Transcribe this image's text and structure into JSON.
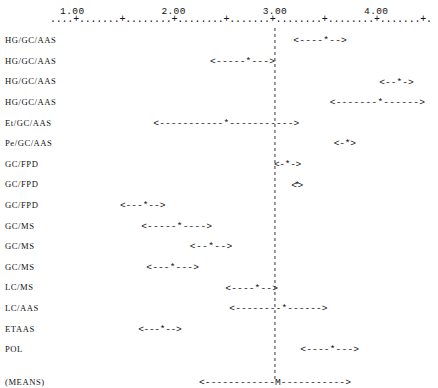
{
  "chart_data": {
    "type": "scatter",
    "plot_style": "ascii-confidence-interval-forest-plot",
    "title": "",
    "subtitle": "",
    "xlabel": "",
    "ylabel": "",
    "xlim": [
      0.75,
      4.6
    ],
    "grid": false,
    "legend": null,
    "axis": {
      "tick_labels": [
        "1.00",
        "2.00",
        "3.00",
        "4.00"
      ],
      "tick_values": [
        1.0,
        2.0,
        3.0,
        4.0
      ],
      "minor_tick_step": 0.5,
      "axis_glyph_major": "+",
      "axis_glyph_minor": ".",
      "axis_start_value": 0.78,
      "axis_end_value": 4.55
    },
    "reference_line": {
      "value": 3.0,
      "style": "dashed",
      "label": ""
    },
    "marker_center": "*",
    "marker_left": "<",
    "marker_right": ">",
    "marker_fill": "-",
    "categories": [
      "HG/GC/AAS",
      "HG/GC/AAS",
      "HG/GC/AAS",
      "HG/GC/AAS",
      "Et/GC/AAS",
      "Pe/GC/AAS",
      "GC/FPD",
      "GC/FPD",
      "GC/FPD",
      "GC/MS",
      "GC/MS",
      "GC/MS",
      "LC/MS",
      "LC/AAS",
      "ETAAS",
      "POL",
      "(MEANS)"
    ],
    "rows": [
      {
        "label": "HG/GC/AAS",
        "center": 3.48,
        "low": 3.18,
        "high": 3.71,
        "marker": "*"
      },
      {
        "label": "HG/GC/AAS",
        "center": 2.68,
        "low": 2.36,
        "high": 3.0,
        "marker": "*"
      },
      {
        "label": "HG/GC/AAS",
        "center": 4.19,
        "low": 4.03,
        "high": 4.37,
        "marker": "*"
      },
      {
        "label": "HG/GC/AAS",
        "center": 4.01,
        "low": 3.54,
        "high": 4.48,
        "marker": "*"
      },
      {
        "label": "Et/GC/AAS",
        "center": 2.51,
        "low": 1.8,
        "high": 3.24,
        "marker": "*"
      },
      {
        "label": "Pe/GC/AAS",
        "center": 3.69,
        "low": 3.58,
        "high": 3.8,
        "marker": "*"
      },
      {
        "label": "GC/FPD",
        "center": 3.11,
        "low": 2.99,
        "high": 3.26,
        "marker": "*"
      },
      {
        "label": "GC/FPD",
        "center": 3.22,
        "low": 3.16,
        "high": 3.28,
        "marker": "*"
      },
      {
        "label": "GC/FPD",
        "center": 1.69,
        "low": 1.47,
        "high": 1.92,
        "marker": "*"
      },
      {
        "label": "GC/MS",
        "center": 2.02,
        "low": 1.68,
        "high": 2.38,
        "marker": "*"
      },
      {
        "label": "GC/MS",
        "center": 2.35,
        "low": 2.16,
        "high": 2.58,
        "marker": "*"
      },
      {
        "label": "GC/MS",
        "center": 1.98,
        "low": 1.73,
        "high": 2.25,
        "marker": "*"
      },
      {
        "label": "LC/MS",
        "center": 2.78,
        "low": 2.51,
        "high": 3.03,
        "marker": "*"
      },
      {
        "label": "LC/AAS",
        "center": 3.04,
        "low": 2.55,
        "high": 3.52,
        "marker": "*"
      },
      {
        "label": "ETAAS",
        "center": 1.87,
        "low": 1.65,
        "high": 2.08,
        "marker": "*"
      },
      {
        "label": "POL",
        "center": 3.55,
        "low": 3.25,
        "high": 3.83,
        "marker": "*"
      },
      {
        "label": "(MEANS)",
        "center": 3.0,
        "low": 2.25,
        "high": 3.75,
        "marker": "M"
      }
    ]
  },
  "layout": {
    "label_column_x": 5,
    "plot_left_x": 50,
    "plot_right_x": 432,
    "axis_y": 22,
    "first_row_y": 40,
    "row_spacing": 20.6,
    "means_extra_gap": 12
  },
  "colors": {
    "text": "#111111",
    "reference_line": "#333333",
    "background": "#ffffff"
  }
}
